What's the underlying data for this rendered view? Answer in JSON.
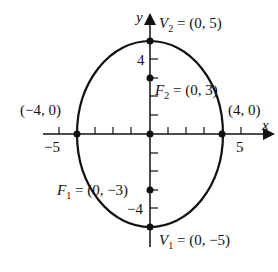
{
  "figure": {
    "type": "ellipse",
    "equation_params": {
      "a": 5,
      "b": 4,
      "c": 3,
      "major_axis": "vertical"
    },
    "axes": {
      "x_label": "x",
      "y_label": "y",
      "x_tick_labels": [
        "−5",
        "5"
      ],
      "y_tick_labels": [
        "4",
        "−4"
      ]
    },
    "points": {
      "v2": {
        "name": "V",
        "sub": "2",
        "text": " = (0, 5)"
      },
      "v1": {
        "name": "V",
        "sub": "1",
        "text": " = (0, −5)"
      },
      "f2": {
        "name": "F",
        "sub": "2",
        "text": " = (0, 3)"
      },
      "f1": {
        "name": "F",
        "sub": "1",
        "text": " = (0, −3)"
      },
      "left": {
        "text": "(−4, 0)"
      },
      "right": {
        "text": "(4, 0)"
      }
    },
    "colors": {
      "stroke": "#111111",
      "background": "#ffffff"
    }
  }
}
